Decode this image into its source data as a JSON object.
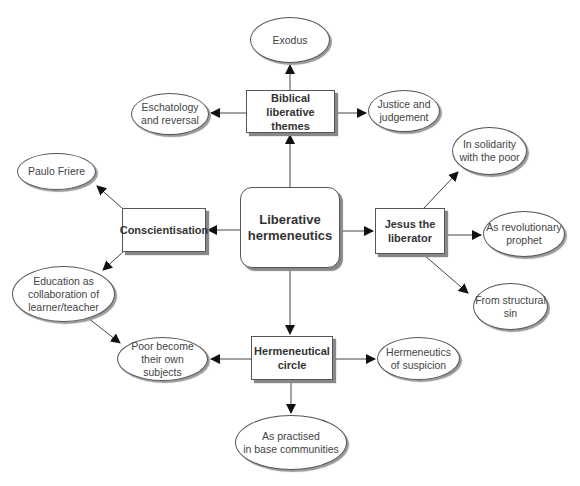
{
  "diagram": {
    "center": {
      "label": "Liberative\nhermeneutics"
    },
    "hubs": {
      "biblical": {
        "label": "Biblical liberative\nthemes"
      },
      "conscientisation": {
        "label": "Conscientisation"
      },
      "jesus": {
        "label": "Jesus the\nliberator"
      },
      "hermeneutical": {
        "label": "Hermeneutical\ncircle"
      }
    },
    "leaves": {
      "exodus": {
        "label": "Exodus"
      },
      "eschatology": {
        "label": "Eschatology\nand reversal"
      },
      "justice": {
        "label": "Justice and\njudgement"
      },
      "paulo": {
        "label": "Paulo Friere"
      },
      "education": {
        "label": "Education as\ncollaboration of\nlearner/teacher"
      },
      "solidarity": {
        "label": "In solidarity\nwith the poor"
      },
      "revolutionary": {
        "label": "As revolutionary\nprophet"
      },
      "structural": {
        "label": "From structural\nsin"
      },
      "poor": {
        "label": "Poor become\ntheir own\nsubjects"
      },
      "suspicion": {
        "label": "Hermeneutics\nof suspicion"
      },
      "base": {
        "label": "As practised\nin base communities"
      }
    },
    "edges": [
      [
        "center",
        "biblical"
      ],
      [
        "center",
        "conscientisation"
      ],
      [
        "center",
        "jesus"
      ],
      [
        "center",
        "hermeneutical"
      ],
      [
        "biblical",
        "exodus"
      ],
      [
        "biblical",
        "eschatology"
      ],
      [
        "biblical",
        "justice"
      ],
      [
        "conscientisation",
        "paulo"
      ],
      [
        "conscientisation",
        "education"
      ],
      [
        "education",
        "poor"
      ],
      [
        "jesus",
        "solidarity"
      ],
      [
        "jesus",
        "revolutionary"
      ],
      [
        "jesus",
        "structural"
      ],
      [
        "hermeneutical",
        "poor"
      ],
      [
        "hermeneutical",
        "suspicion"
      ],
      [
        "hermeneutical",
        "base"
      ]
    ]
  }
}
